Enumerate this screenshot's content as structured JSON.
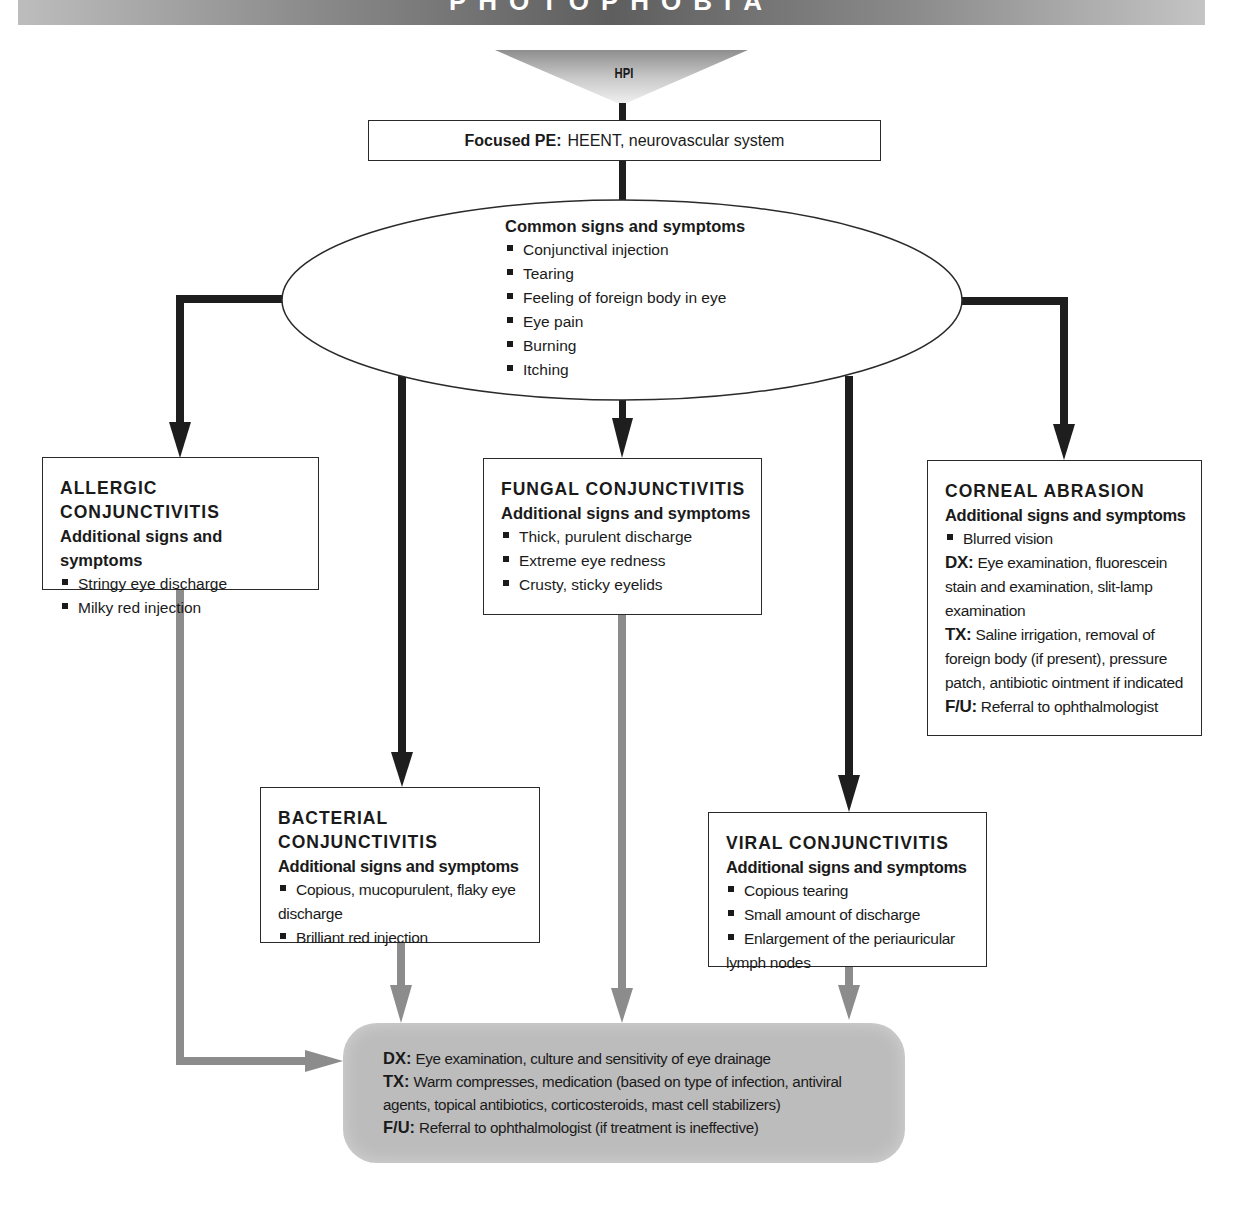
{
  "header": {
    "title": "PHOTOPHOBIA"
  },
  "hpi": {
    "label": "HPI"
  },
  "focused_pe": {
    "label": "Focused PE:",
    "text": "HEENT, neurovascular system"
  },
  "common": {
    "heading": "Common signs and symptoms",
    "items": [
      "Conjunctival injection",
      "Tearing",
      "Feeling of foreign body in eye",
      "Eye pain",
      "Burning",
      "Itching"
    ]
  },
  "allergic": {
    "title": "ALLERGIC CONJUNCTIVITIS",
    "subtitle": "Additional signs and symptoms",
    "items": [
      "Stringy eye discharge",
      "Milky red injection"
    ]
  },
  "fungal": {
    "title": "FUNGAL CONJUNCTIVITIS",
    "subtitle": "Additional signs and symptoms",
    "items": [
      "Thick, purulent discharge",
      "Extreme eye redness",
      "Crusty, sticky eyelids"
    ]
  },
  "corneal": {
    "title": "CORNEAL ABRASION",
    "subtitle": "Additional signs and symptoms",
    "items": [
      "Blurred vision"
    ],
    "dx_label": "DX:",
    "dx": "Eye examination, fluorescein stain and examination, slit-lamp examination",
    "tx_label": "TX:",
    "tx": "Saline irrigation, removal of foreign body (if present), pressure patch, antibiotic ointment if indicated",
    "fu_label": "F/U:",
    "fu": "Referral to ophthalmologist"
  },
  "bacterial": {
    "title": "BACTERIAL CONJUNCTIVITIS",
    "subtitle": "Additional signs and symptoms",
    "items": [
      "Copious, mucopurulent, flaky eye discharge",
      "Brilliant red injection"
    ]
  },
  "viral": {
    "title": "VIRAL CONJUNCTIVITIS",
    "subtitle": "Additional signs and symptoms",
    "items": [
      "Copious tearing",
      "Small amount of discharge",
      "Enlargement of the periauricular lymph nodes"
    ]
  },
  "outcome": {
    "dx_label": "DX:",
    "dx": "Eye examination, culture and sensitivity of eye drainage",
    "tx_label": "TX:",
    "tx": "Warm compresses, medication (based on type of infection, antiviral agents, topical antibiotics, corticosteroids, mast cell stabilizers)",
    "fu_label": "F/U:",
    "fu": "Referral to ophthalmologist (if treatment is ineffective)"
  },
  "colors": {
    "dark_connector": "#1e1e1e",
    "gray_connector": "#8c8c8c",
    "outcome_fill": "#bcbcbc"
  }
}
